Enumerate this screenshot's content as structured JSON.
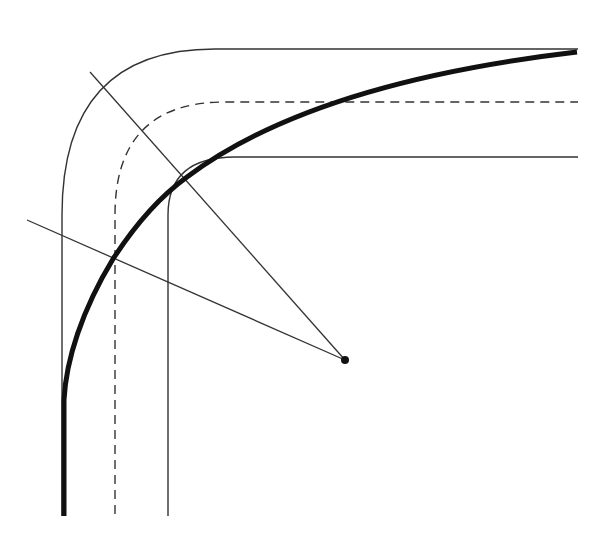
{
  "diagram": {
    "title": "",
    "colors": {
      "background": "#ffffff",
      "ink": "#111111",
      "thin_line": "#333333"
    },
    "elements": {
      "outer_edge": {
        "label": "",
        "style": "thin solid"
      },
      "centerline": {
        "label": "",
        "style": "dashed"
      },
      "inner_edge": {
        "label": "",
        "style": "thin solid"
      },
      "transition_curve": {
        "label": "",
        "style": "thick solid"
      },
      "radial_line_1": {
        "label": "",
        "style": "thin solid"
      },
      "radial_line_2": {
        "label": "",
        "style": "thin solid"
      },
      "center_point": {
        "label": "",
        "style": "filled dot"
      }
    }
  }
}
